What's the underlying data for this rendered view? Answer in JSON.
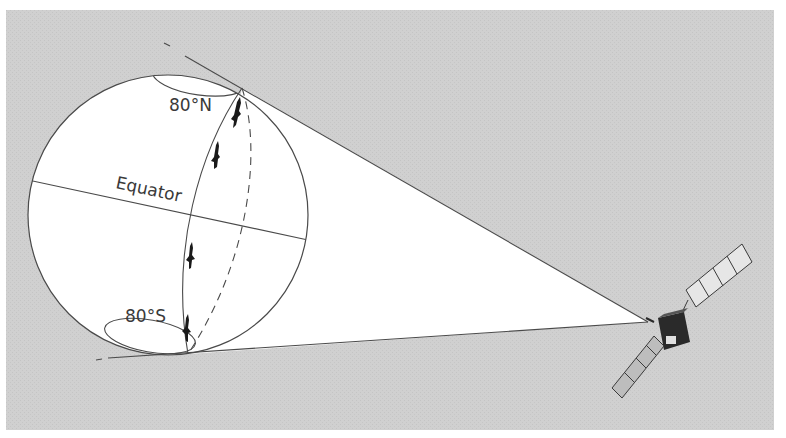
{
  "figure": {
    "colors": {
      "panel": "#cfcfcf",
      "globe": "#ffffff",
      "cone": "#ffffff",
      "line": "#4a4a4a",
      "aircraft": "#1a1a1a",
      "satellite_body": "#2a2a2a"
    },
    "labels": {
      "north_limit": "80°N",
      "south_limit": "80°S",
      "equator": "Equator"
    },
    "elements": {
      "globe": "Earth sphere",
      "cone": "satellite field of view",
      "ground_track": "orbit track (front solid, back dashed)",
      "polar_caps": [
        "north polar cap",
        "south polar cap"
      ],
      "tracked_objects_count": 4,
      "satellite": "satellite with two solar panel arrays"
    }
  }
}
